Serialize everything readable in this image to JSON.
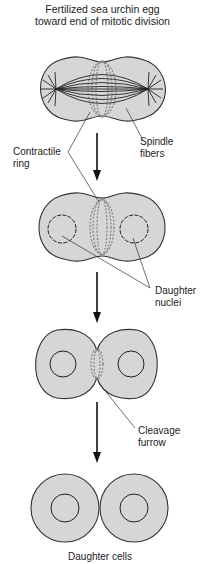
{
  "title": {
    "line1": "Fertilized sea urchin egg",
    "line2": "toward end of mitotic division"
  },
  "labels": {
    "spindle_fibers": {
      "line1": "Spindle",
      "line2": "fibers"
    },
    "contractile_ring": {
      "line1": "Contractile",
      "line2": "ring"
    },
    "daughter_nuclei": {
      "line1": "Daughter",
      "line2": "nuclei"
    },
    "cleavage_furrow": {
      "line1": "Cleavage",
      "line2": "furrow"
    },
    "daughter_cells": "Daughter cells"
  },
  "stages": [
    "Egg with spindle and contractile ring",
    "Ring contracting, daughter nuclei forming",
    "Cleavage furrow deepening",
    "Two daughter cells"
  ],
  "colors": {
    "cell_fill": "#d6d6d6",
    "outline": "#333333",
    "ring": "#8a8a8a"
  }
}
